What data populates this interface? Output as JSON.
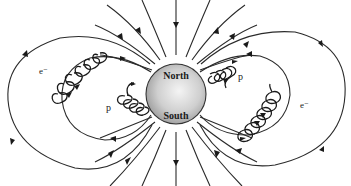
{
  "diagram": {
    "planet": {
      "north_label": "North",
      "south_label": "South",
      "fill_color": "#d8d8d8"
    },
    "particles": [
      {
        "label": "e⁻",
        "position": "upper-left outer loop"
      },
      {
        "label": "p",
        "position": "left inner loop"
      },
      {
        "label": "p",
        "position": "right inner loop"
      },
      {
        "label": "e⁻",
        "position": "lower-right outer loop"
      }
    ],
    "labels": {
      "electron_left": "e⁻",
      "proton_left": "p",
      "proton_right": "p",
      "electron_right": "e⁻"
    },
    "line_color": "#2a2a2a"
  }
}
